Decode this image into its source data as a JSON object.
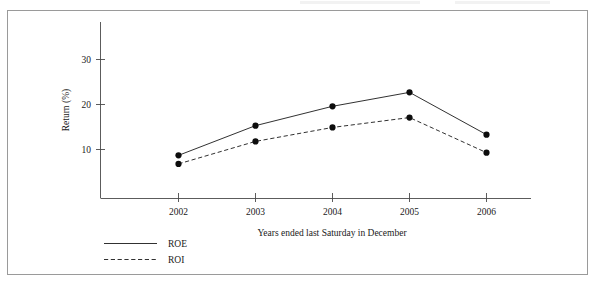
{
  "chart_data": {
    "type": "line",
    "title": "",
    "subtitle": "",
    "xlabel": "Years ended last Saturday in December",
    "ylabel": "Return (%)",
    "categories": [
      "2002",
      "2003",
      "2004",
      "2005",
      "2006"
    ],
    "x": [
      2002,
      2003,
      2004,
      2005,
      2006
    ],
    "series": [
      {
        "name": "ROE",
        "style": "solid",
        "marker": "filled-circle",
        "color": "#1a1a1a",
        "values": [
          8.7,
          15.3,
          19.6,
          22.7,
          13.3
        ]
      },
      {
        "name": "ROI",
        "style": "dashed",
        "marker": "filled-circle",
        "color": "#1a1a1a",
        "values": [
          6.8,
          11.8,
          14.9,
          17.1,
          9.3
        ]
      }
    ],
    "ylim": [
      0,
      36
    ],
    "yticks": [
      10,
      20,
      30
    ],
    "ytick_labels": [
      "10",
      "20",
      "30"
    ],
    "xtick_labels": [
      "2002",
      "2003",
      "2004",
      "2005",
      "2006"
    ],
    "grid": false,
    "legend_position": "bottom-left",
    "legend_entries": [
      {
        "label": "ROE",
        "style": "solid"
      },
      {
        "label": "ROI",
        "style": "dashed"
      }
    ]
  },
  "axes": {
    "y_label": "Return (%)",
    "x_label": "Years ended last Saturday in December",
    "y_ticks": [
      {
        "label": "30",
        "value": 30
      },
      {
        "label": "20",
        "value": 20
      },
      {
        "label": "10",
        "value": 10
      }
    ],
    "x_ticks": [
      {
        "label": "2002"
      },
      {
        "label": "2003"
      },
      {
        "label": "2004"
      },
      {
        "label": "2005"
      },
      {
        "label": "2006"
      }
    ]
  },
  "legend": {
    "roe_label": "ROE",
    "roi_label": "ROI"
  },
  "colors": {
    "ink": "#1a1a1a",
    "axis": "#4a4a4a",
    "frame": "#9a9a9a",
    "background": "#ffffff"
  }
}
